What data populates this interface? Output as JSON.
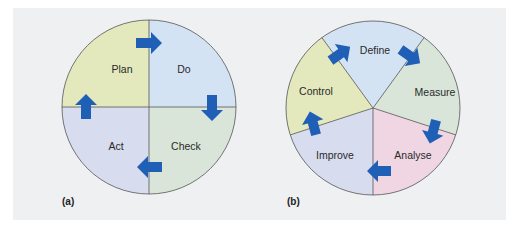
{
  "figure_a": {
    "caption": "(a)",
    "segments": [
      {
        "label": "Plan",
        "color": "#e3e8bd"
      },
      {
        "label": "Do",
        "color": "#d3e3f4"
      },
      {
        "label": "Check",
        "color": "#d9e5d9"
      },
      {
        "label": "Act",
        "color": "#d8dcef"
      }
    ]
  },
  "figure_b": {
    "caption": "(b)",
    "segments": [
      {
        "label": "Define",
        "color": "#d3e3f4"
      },
      {
        "label": "Measure",
        "color": "#d9e5d9"
      },
      {
        "label": "Analyse",
        "color": "#f0d6e3"
      },
      {
        "label": "Improve",
        "color": "#d8dcef"
      },
      {
        "label": "Control",
        "color": "#e3e8bd"
      }
    ]
  },
  "colors": {
    "arrow": "#1f5fb5",
    "outline": "#555555",
    "panel": "#eef0f2"
  }
}
